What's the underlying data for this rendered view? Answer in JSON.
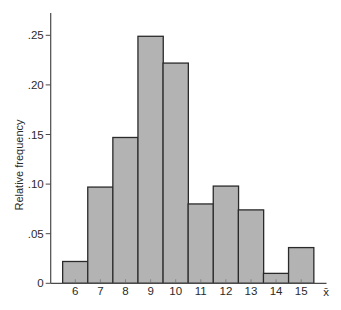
{
  "chart_data": {
    "type": "bar",
    "subtype": "histogram",
    "title": "",
    "xlabel": "x̄",
    "ylabel": "Relative frequency",
    "categories": [
      "6",
      "7",
      "8",
      "9",
      "10",
      "11",
      "12",
      "13",
      "14",
      "15"
    ],
    "values": [
      0.022,
      0.097,
      0.147,
      0.249,
      0.222,
      0.08,
      0.098,
      0.074,
      0.01,
      0.036
    ],
    "yticks": [
      0,
      0.05,
      0.1,
      0.15,
      0.2,
      0.25
    ],
    "ytick_labels": [
      "0",
      ".05",
      ".10",
      ".15",
      ".20",
      ".25"
    ],
    "ylim": [
      0,
      0.275
    ],
    "grid": false,
    "legend": null,
    "bar_fill": "#b3b3b3",
    "bar_edge": "#2a2a2a"
  }
}
